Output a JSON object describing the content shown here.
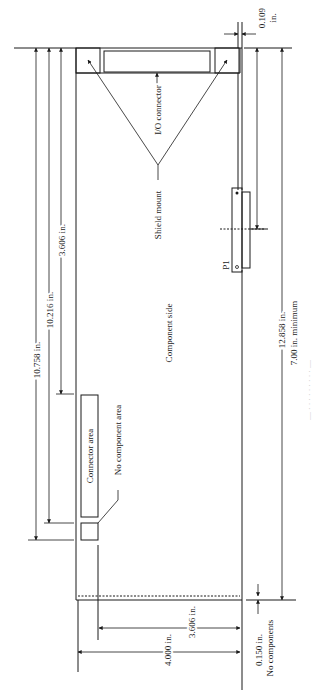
{
  "figure": {
    "type": "board-outline-dimension-drawing",
    "orientation": "rotated-90",
    "caption": "Figure (faint, partially cropped caption along right edge)"
  },
  "labels": {
    "component_side": "Component side",
    "io_connector": "I/O connector",
    "shield_mount": "Shield mount",
    "p1": "P1",
    "connector_area": "Connector area",
    "no_component_area": "No component area",
    "no_components": "No components"
  },
  "dimensions": {
    "d_10_758": "10.758 in.",
    "d_10_216": "10.216 in.",
    "d_3_606_top": "3.606 in.",
    "d_0_109": "0.109",
    "d_0_109_unit": "in.",
    "d_12_858": "12.858 in.",
    "d_7_00_min": "7.00 in. minimum",
    "d_3_606_bottom": "3.606 in.",
    "d_4_000": "4.000 in.",
    "d_0_150": "0.150 in."
  },
  "colors": {
    "line": "#1a1a1a",
    "background": "#ffffff",
    "caption": "#c8c8c8"
  }
}
